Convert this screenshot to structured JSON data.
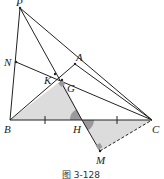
{
  "diagram": {
    "caption": "图 3-128",
    "points": {
      "P": {
        "label": "P",
        "x": 20,
        "y": 8
      },
      "N": {
        "label": "N",
        "x": 16,
        "y": 62
      },
      "B": {
        "label": "B",
        "x": 10,
        "y": 120
      },
      "K": {
        "label": "K",
        "x": 55,
        "y": 74
      },
      "A": {
        "label": "A",
        "x": 75,
        "y": 64
      },
      "G": {
        "label": "G",
        "x": 62,
        "y": 80
      },
      "H": {
        "label": "H",
        "x": 82,
        "y": 120
      },
      "C": {
        "label": "C",
        "x": 152,
        "y": 120
      },
      "M": {
        "label": "M",
        "x": 100,
        "y": 151
      }
    },
    "colors": {
      "line": "#222222",
      "shade": "#d9d9d9",
      "angle": "#9a9a9a"
    }
  }
}
